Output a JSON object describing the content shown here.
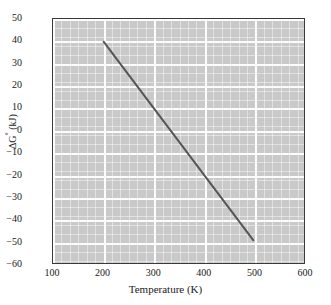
{
  "chart_data": {
    "type": "line",
    "title": "",
    "xlabel": "Temperature (K)",
    "ylabel": "ΔG° (kJ)",
    "ylabel_base": "ΔG",
    "ylabel_sup": "°",
    "ylabel_units": " (kJ)",
    "xlim": [
      100,
      600
    ],
    "ylim": [
      -60,
      50
    ],
    "xticks": [
      100,
      200,
      300,
      400,
      500,
      600
    ],
    "yticks": [
      50,
      40,
      30,
      20,
      10,
      0,
      -10,
      -20,
      -30,
      -40,
      -50,
      -60
    ],
    "xtick_labels": [
      "100",
      "200",
      "300",
      "400",
      "500",
      "600"
    ],
    "ytick_labels": [
      "50",
      "40",
      "30",
      "20",
      "10",
      "0",
      "−10",
      "−20",
      "−30",
      "−40",
      "−50",
      "−60"
    ],
    "grid": true,
    "grid_major_color": "#ffffff",
    "grid_minor_color": "#ffffff",
    "minor_ticks_per_major_x": 6,
    "minor_ticks_per_major_y": 2.5,
    "plot_bgcolor": "#c9c9c9",
    "frame_color": "#3a3a3a",
    "legend": null,
    "series": [
      {
        "name": "ΔG° vs T",
        "color": "#555555",
        "line_width": 2,
        "x": [
          200,
          500
        ],
        "y": [
          40,
          -50
        ],
        "slope_kJ_per_K": -0.3,
        "intercept_kJ": 100
      }
    ]
  },
  "axis": {
    "x": {
      "ticks": [
        {
          "value": 100,
          "label": "100"
        },
        {
          "value": 200,
          "label": "200"
        },
        {
          "value": 300,
          "label": "300"
        },
        {
          "value": 400,
          "label": "400"
        },
        {
          "value": 500,
          "label": "500"
        },
        {
          "value": 600,
          "label": "600"
        }
      ]
    },
    "y": {
      "ticks": [
        {
          "value": 50,
          "label": "50"
        },
        {
          "value": 40,
          "label": "40"
        },
        {
          "value": 30,
          "label": "30"
        },
        {
          "value": 20,
          "label": "20"
        },
        {
          "value": 10,
          "label": "10"
        },
        {
          "value": 0,
          "label": "0"
        },
        {
          "value": -10,
          "label": "−10"
        },
        {
          "value": -20,
          "label": "−20"
        },
        {
          "value": -30,
          "label": "−30"
        },
        {
          "value": -40,
          "label": "−40"
        },
        {
          "value": -50,
          "label": "−50"
        },
        {
          "value": -60,
          "label": "−60"
        }
      ]
    }
  }
}
